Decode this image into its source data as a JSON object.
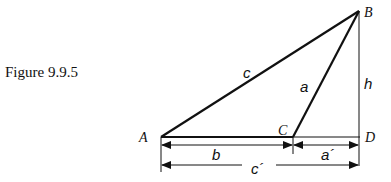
{
  "figure": {
    "caption": "Figure 9.9.5"
  },
  "vertices": {
    "A": "A",
    "B": "B",
    "C": "C",
    "D": "D"
  },
  "sides": {
    "c": "c",
    "a": "a",
    "h": "h"
  },
  "dimensions": {
    "b": "b",
    "a_prime": "a´",
    "c_prime": "c´"
  },
  "colors": {
    "stroke": "#111111",
    "background": "#ffffff"
  }
}
